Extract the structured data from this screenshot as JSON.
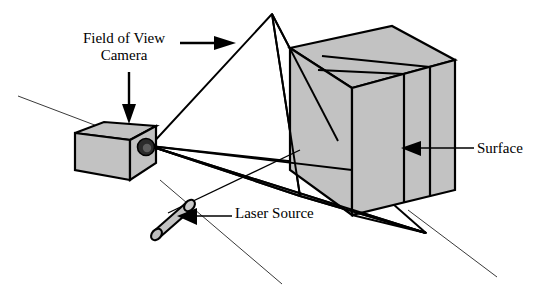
{
  "figure": {
    "kind": "technical-diagram",
    "background_color": "#ffffff",
    "stroke_color": "#000000",
    "fill_gray": "#c0c0c0"
  },
  "labels": {
    "field_of_view_line1": "Field of View",
    "field_of_view_line2": "Camera",
    "surface": "Surface",
    "laser_source": "Laser Source"
  },
  "components": {
    "camera": {
      "name": "Camera",
      "shape": "rectangular-box",
      "fill": "#c0c0c0",
      "lens": {
        "shape": "circle",
        "fill": "#555555"
      }
    },
    "laser_source": {
      "name": "Laser Source",
      "shape": "cylinder",
      "fill": "#c0c0c0"
    },
    "surface": {
      "name": "Surface",
      "shape": "rectangular-slab",
      "fill": "#c0c0c0"
    },
    "field_of_view": {
      "name": "Field of View",
      "shape": "pyramid-cone",
      "fill": "none",
      "apex": "camera-lens"
    }
  },
  "annotations": [
    {
      "id": "fov-arrow",
      "target": "field-of-view",
      "direction": "right",
      "label": "Field of View"
    },
    {
      "id": "camera-arrow",
      "target": "camera",
      "direction": "down",
      "label": "Camera"
    },
    {
      "id": "surface-arrow",
      "target": "surface",
      "direction": "left",
      "label": "Surface"
    },
    {
      "id": "laser-arrow",
      "target": "laser-source",
      "direction": "left",
      "label": "Laser Source"
    }
  ]
}
